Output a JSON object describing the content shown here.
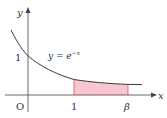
{
  "axes": {
    "x_label": "x",
    "y_label": "y",
    "origin_label": "O"
  },
  "ticks": {
    "y_one": "1",
    "x_one": "1",
    "x_beta": "β"
  },
  "curve": {
    "equation_lhs": "y = e",
    "equation_exp": "−x",
    "color": "#3a3a3a"
  },
  "region": {
    "from": "1",
    "to": "β",
    "fill_color": "#f7c6cf",
    "edge_color": "#d9506a"
  }
}
